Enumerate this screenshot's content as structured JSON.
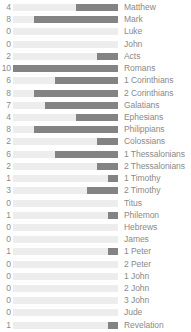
{
  "chart_data": {
    "type": "bar",
    "title": "",
    "subtitle": "",
    "xlabel": "",
    "ylabel": "",
    "orientation": "horizontal",
    "grid": false,
    "legend": null,
    "xlim": [
      0,
      10
    ],
    "max_value": 10,
    "bar_alignment": "right",
    "colors": {
      "track": "#ededed",
      "fill": "#838383",
      "text": "#8a8a8a",
      "background": "#ffffff"
    },
    "categories": [
      "Matthew",
      "Mark",
      "Luke",
      "John",
      "Acts",
      "Romans",
      "1 Corinthians",
      "2 Corinthians",
      "Galatians",
      "Ephesians",
      "Philippians",
      "Colossians",
      "1 Thessalonians",
      "2 Thessalonians",
      "1 Timothy",
      "2 Timothy",
      "Titus",
      "Philemon",
      "Hebrews",
      "James",
      "1 Peter",
      "2 Peter",
      "1 John",
      "2 John",
      "3 John",
      "Jude",
      "Revelation"
    ],
    "values": [
      4,
      8,
      0,
      0,
      2,
      10,
      6,
      8,
      7,
      4,
      8,
      2,
      6,
      2,
      1,
      3,
      0,
      1,
      0,
      0,
      1,
      0,
      0,
      0,
      0,
      0,
      1
    ],
    "rows": [
      {
        "label": "Matthew",
        "value": 4,
        "value_text": "4"
      },
      {
        "label": "Mark",
        "value": 8,
        "value_text": "8"
      },
      {
        "label": "Luke",
        "value": 0,
        "value_text": "0"
      },
      {
        "label": "John",
        "value": 0,
        "value_text": "0"
      },
      {
        "label": "Acts",
        "value": 2,
        "value_text": "2"
      },
      {
        "label": "Romans",
        "value": 10,
        "value_text": "10"
      },
      {
        "label": "1 Corinthians",
        "value": 6,
        "value_text": "6"
      },
      {
        "label": "2 Corinthians",
        "value": 8,
        "value_text": "8"
      },
      {
        "label": "Galatians",
        "value": 7,
        "value_text": "7"
      },
      {
        "label": "Ephesians",
        "value": 4,
        "value_text": "4"
      },
      {
        "label": "Philippians",
        "value": 8,
        "value_text": "8"
      },
      {
        "label": "Colossians",
        "value": 2,
        "value_text": "2"
      },
      {
        "label": "1 Thessalonians",
        "value": 6,
        "value_text": "6"
      },
      {
        "label": "2 Thessalonians",
        "value": 2,
        "value_text": "2"
      },
      {
        "label": "1 Timothy",
        "value": 1,
        "value_text": "1"
      },
      {
        "label": "2 Timothy",
        "value": 3,
        "value_text": "3"
      },
      {
        "label": "Titus",
        "value": 0,
        "value_text": "0"
      },
      {
        "label": "Philemon",
        "value": 1,
        "value_text": "1"
      },
      {
        "label": "Hebrews",
        "value": 0,
        "value_text": "0"
      },
      {
        "label": "James",
        "value": 0,
        "value_text": "0"
      },
      {
        "label": "1 Peter",
        "value": 1,
        "value_text": "1"
      },
      {
        "label": "2 Peter",
        "value": 0,
        "value_text": "0"
      },
      {
        "label": "1 John",
        "value": 0,
        "value_text": "0"
      },
      {
        "label": "2 John",
        "value": 0,
        "value_text": "0"
      },
      {
        "label": "3 John",
        "value": 0,
        "value_text": "0"
      },
      {
        "label": "Jude",
        "value": 0,
        "value_text": "0"
      },
      {
        "label": "Revelation",
        "value": 1,
        "value_text": "1"
      }
    ]
  }
}
